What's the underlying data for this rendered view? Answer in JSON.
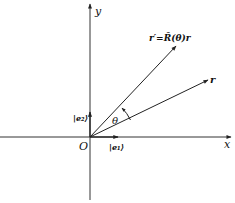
{
  "diagram": {
    "type": "vector-rotation",
    "colors": {
      "line": "#222222",
      "background": "#ffffff"
    },
    "axes": {
      "x_label": "x",
      "y_label": "y",
      "origin_label": "O"
    },
    "basis": {
      "e1_label": "|e₁⟩",
      "e2_label": "|e₂⟩"
    },
    "vectors": {
      "r_label": "r",
      "r_prime_label": "r′=R̂(θ)r"
    },
    "angle_label": "θ"
  }
}
